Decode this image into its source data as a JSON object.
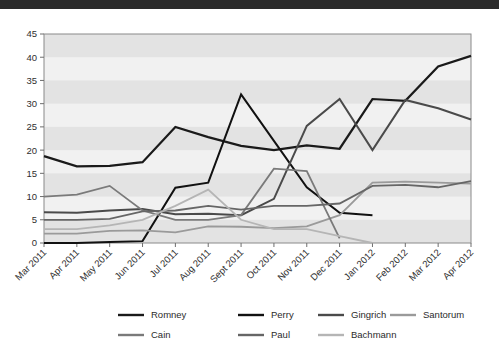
{
  "window": {
    "topbar_color": "#2b2b2b",
    "background_color": "#ffffff"
  },
  "chart_data": {
    "type": "line",
    "title": "",
    "subtitle": "",
    "xlabel": "",
    "ylabel": "",
    "grid": "horizontal-banding",
    "legend_position": "bottom",
    "ylim": [
      0,
      45
    ],
    "yticks": [
      0,
      5,
      10,
      15,
      20,
      25,
      30,
      35,
      40,
      45
    ],
    "ytick_labels": [
      "0",
      "5",
      "10",
      "15",
      "20",
      "25",
      "30",
      "35",
      "40",
      "45"
    ],
    "categories": [
      "Mar 2011",
      "Apr 2011",
      "May 2011",
      "Jun 2011",
      "Jul 2011",
      "Aug 2011",
      "Sept 2011",
      "Oct 2011",
      "Nov 2011",
      "Dec 2011",
      "Jan 2012",
      "Feb 2012",
      "Mar 2012",
      "Apr 2012"
    ],
    "series": [
      {
        "name": "Romney",
        "color": "#1a1a1a",
        "width": 2.2,
        "values": [
          18.7,
          16.5,
          16.6,
          17.4,
          25.0,
          22.8,
          20.9,
          20.0,
          21.0,
          20.3,
          31.0,
          30.6,
          38.0,
          40.3
        ]
      },
      {
        "name": "Perry",
        "color": "#111111",
        "width": 2.0,
        "values": [
          0.0,
          0.0,
          0.2,
          0.4,
          11.9,
          13.0,
          32.0,
          22.0,
          12.0,
          6.5,
          6.0,
          null,
          null,
          null
        ]
      },
      {
        "name": "Gingrich",
        "color": "#4a4a4a",
        "width": 2.0,
        "values": [
          6.6,
          6.5,
          7.0,
          7.3,
          6.2,
          6.3,
          6.0,
          9.5,
          25.2,
          31.0,
          20.0,
          30.8,
          29.0,
          26.6
        ]
      },
      {
        "name": "Santorum",
        "color": "#9a9a9a",
        "width": 1.8,
        "values": [
          2.0,
          2.0,
          2.6,
          2.7,
          2.3,
          3.6,
          3.5,
          3.2,
          3.6,
          6.0,
          13.0,
          13.2,
          13.0,
          12.8
        ]
      },
      {
        "name": "Cain",
        "color": "#7a7a7a",
        "width": 1.8,
        "values": [
          10.0,
          10.4,
          12.3,
          7.0,
          5.0,
          5.0,
          6.0,
          16.0,
          15.5,
          1.0,
          null,
          null,
          null,
          null
        ]
      },
      {
        "name": "Paul",
        "color": "#666666",
        "width": 1.8,
        "values": [
          5.0,
          5.0,
          5.2,
          6.8,
          7.0,
          8.0,
          7.2,
          8.0,
          8.0,
          8.5,
          12.3,
          12.5,
          12.0,
          13.3
        ]
      },
      {
        "name": "Bachmann",
        "color": "#b5b5b5",
        "width": 1.8,
        "values": [
          3.0,
          3.0,
          3.8,
          5.0,
          8.0,
          11.5,
          5.0,
          3.0,
          3.0,
          1.5,
          0.0,
          null,
          null,
          null
        ]
      }
    ],
    "legend": [
      {
        "label": "Romney",
        "color": "#1a1a1a"
      },
      {
        "label": "Perry",
        "color": "#111111"
      },
      {
        "label": "Gingrich",
        "color": "#4a4a4a"
      },
      {
        "label": "Santorum",
        "color": "#9a9a9a"
      },
      {
        "label": "Cain",
        "color": "#7a7a7a"
      },
      {
        "label": "Paul",
        "color": "#666666"
      },
      {
        "label": "Bachmann",
        "color": "#b5b5b5"
      }
    ]
  }
}
